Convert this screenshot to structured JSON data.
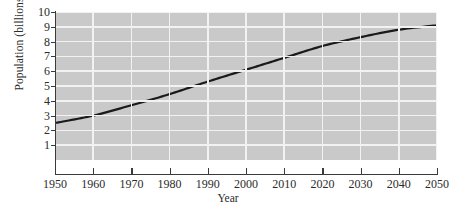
{
  "chart_data": {
    "type": "line",
    "title": "",
    "xlabel": "Year",
    "ylabel": "Population (billions)",
    "xlim": [
      1950,
      2050
    ],
    "ylim": [
      0,
      10
    ],
    "xticks": [
      1950,
      1960,
      1970,
      1980,
      1990,
      2000,
      2010,
      2020,
      2030,
      2040,
      2050
    ],
    "yticks": [
      1,
      2,
      3,
      4,
      5,
      6,
      7,
      8,
      9,
      10
    ],
    "grid": "both",
    "legend": "none",
    "x": [
      1950,
      1960,
      1970,
      1980,
      1990,
      2000,
      2010,
      2020,
      2030,
      2040,
      2050
    ],
    "values": [
      2.5,
      3.0,
      3.7,
      4.45,
      5.3,
      6.1,
      6.9,
      7.7,
      8.3,
      8.8,
      9.1
    ],
    "series": [
      {
        "name": "World population",
        "values": [
          2.5,
          3.0,
          3.7,
          4.45,
          5.3,
          6.1,
          6.9,
          7.7,
          8.3,
          8.8,
          9.1
        ]
      }
    ],
    "line_color": "#1a1a1a",
    "plot_background": "#c9c9c9",
    "gridline_color": "#f2f2f2"
  },
  "axes": {
    "y_title": "Population (billions)",
    "x_title": "Year",
    "y_ticklabels": [
      "10",
      "9",
      "8",
      "7",
      "6",
      "5",
      "4",
      "3",
      "2",
      "1"
    ],
    "x_ticklabels": [
      "1950",
      "1960",
      "1970",
      "1980",
      "1990",
      "2000",
      "2010",
      "2020",
      "2030",
      "2040",
      "2050"
    ]
  }
}
